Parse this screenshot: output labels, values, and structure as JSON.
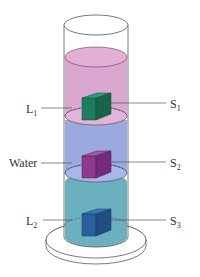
{
  "diagram": {
    "labels": {
      "l1": {
        "main": "L",
        "sub": "1"
      },
      "water": {
        "main": "Water"
      },
      "l2": {
        "main": "L",
        "sub": "2"
      },
      "s1": {
        "main": "S",
        "sub": "1"
      },
      "s2": {
        "main": "S",
        "sub": "2"
      },
      "s3": {
        "main": "S",
        "sub": "3"
      }
    },
    "layers": [
      {
        "name": "L1",
        "color": "#d9a7cf"
      },
      {
        "name": "Water",
        "color": "#9aa9de"
      },
      {
        "name": "L2",
        "color": "#6bb0bf"
      }
    ],
    "solids": [
      {
        "name": "S1",
        "front": "#1e7d5e",
        "top": "#2f9a74",
        "side": "#176548"
      },
      {
        "name": "S2",
        "front": "#8e3a8c",
        "top": "#a953a6",
        "side": "#74297a"
      },
      {
        "name": "S3",
        "front": "#2a5f9a",
        "top": "#3a77b5",
        "side": "#214d80"
      }
    ],
    "colors": {
      "outline": "#555555",
      "interface_dash": "#3d3d6a"
    }
  }
}
